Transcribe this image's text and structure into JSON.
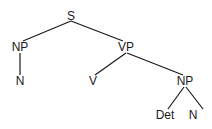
{
  "diagram": {
    "type": "syntax-tree",
    "line_color": "#1a1a1a",
    "nodes": [
      {
        "id": "S",
        "label": "S",
        "x": 71,
        "y": 16
      },
      {
        "id": "NP1",
        "label": "NP",
        "x": 20,
        "y": 47
      },
      {
        "id": "N1",
        "label": "N",
        "x": 20,
        "y": 81
      },
      {
        "id": "VP",
        "label": "VP",
        "x": 126,
        "y": 47
      },
      {
        "id": "V",
        "label": "V",
        "x": 93,
        "y": 81
      },
      {
        "id": "NP2",
        "label": "NP",
        "x": 185,
        "y": 81
      },
      {
        "id": "Det",
        "label": "Det",
        "x": 165,
        "y": 115
      },
      {
        "id": "N2",
        "label": "N",
        "x": 193,
        "y": 115
      }
    ],
    "edges": [
      {
        "from": "S",
        "to": "NP1"
      },
      {
        "from": "S",
        "to": "VP"
      },
      {
        "from": "NP1",
        "to": "N1"
      },
      {
        "from": "VP",
        "to": "V"
      },
      {
        "from": "VP",
        "to": "NP2"
      },
      {
        "from": "NP2",
        "to": "Det"
      },
      {
        "from": "NP2",
        "to": "N2"
      }
    ]
  }
}
